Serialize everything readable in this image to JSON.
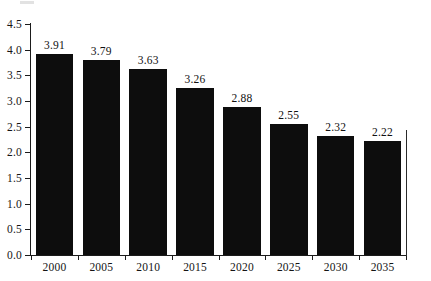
{
  "chart_data": {
    "type": "bar",
    "title": "",
    "subtitle": "",
    "xlabel": "",
    "ylabel": "",
    "categories": [
      "2000",
      "2005",
      "2010",
      "2015",
      "2020",
      "2025",
      "2030",
      "2035"
    ],
    "values": [
      3.91,
      3.79,
      3.63,
      3.26,
      2.88,
      2.55,
      2.32,
      2.22
    ],
    "value_labels": [
      "3.91",
      "3.79",
      "3.63",
      "3.26",
      "2.88",
      "2.55",
      "2.32",
      "2.22"
    ],
    "ylim": [
      0.0,
      4.5
    ],
    "ytick_labels": [
      "0.0",
      "0.5",
      "1.0",
      "1.5",
      "2.0",
      "2.5",
      "3.0",
      "3.5",
      "4.0",
      "4.5"
    ],
    "ytick_values": [
      0.0,
      0.5,
      1.0,
      1.5,
      2.0,
      2.5,
      3.0,
      3.5,
      4.0,
      4.5
    ],
    "grid": false,
    "legend": null,
    "legend_position": "none",
    "bar_color": "#0d0d0d",
    "axis_color": "#1b1b1b",
    "text_color": "#151515",
    "background": "#ffffff",
    "annotations": []
  }
}
